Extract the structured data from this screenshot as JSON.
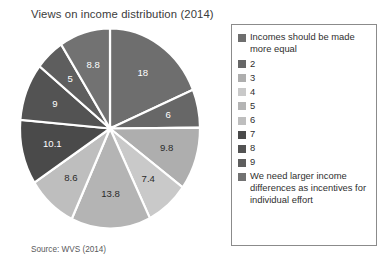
{
  "chart_data": {
    "type": "pie",
    "title": "Views on income distribution (2014)",
    "source_note": "Source: WVS (2014)",
    "categories": [
      "Incomes should be made more equal",
      "2",
      "3",
      "4",
      "5",
      "6",
      "7",
      "8",
      "9",
      "We need larger income differences as incentives for individual effort"
    ],
    "values": [
      18,
      6,
      9.8,
      7.4,
      13.8,
      8.6,
      10.1,
      9,
      5,
      8.8
    ],
    "value_labels": [
      "18",
      "6",
      "9.8",
      "7.4",
      "13.8",
      "8.6",
      "10.1",
      "9",
      "5",
      "8.8"
    ],
    "colors": [
      "#6e6e6e",
      "#676767",
      "#aeaeae",
      "#c9c9c9",
      "#b4b4b4",
      "#bebebe",
      "#4a4a4a",
      "#535353",
      "#5e5e5e",
      "#727272"
    ],
    "label_on_dark": [
      true,
      true,
      false,
      false,
      false,
      false,
      true,
      true,
      true,
      true
    ],
    "total": 96.5,
    "start_angle_deg": 0,
    "direction": "clockwise",
    "legend_position": "right",
    "grid": false,
    "xlabel": "",
    "ylabel": ""
  },
  "legend": {
    "entries": [
      {
        "label": "Incomes should be made more equal",
        "color": "#6e6e6e",
        "multiline": true
      },
      {
        "label": "2",
        "color": "#676767",
        "multiline": false
      },
      {
        "label": "3",
        "color": "#aeaeae",
        "multiline": false
      },
      {
        "label": "4",
        "color": "#c9c9c9",
        "multiline": false
      },
      {
        "label": "5",
        "color": "#b4b4b4",
        "multiline": false
      },
      {
        "label": "6",
        "color": "#bebebe",
        "multiline": false
      },
      {
        "label": "7",
        "color": "#4a4a4a",
        "multiline": false
      },
      {
        "label": "8",
        "color": "#535353",
        "multiline": false
      },
      {
        "label": "9",
        "color": "#5e5e5e",
        "multiline": false
      },
      {
        "label": "We need larger income differences as incentives for individual effort",
        "color": "#727272",
        "multiline": true
      }
    ]
  }
}
